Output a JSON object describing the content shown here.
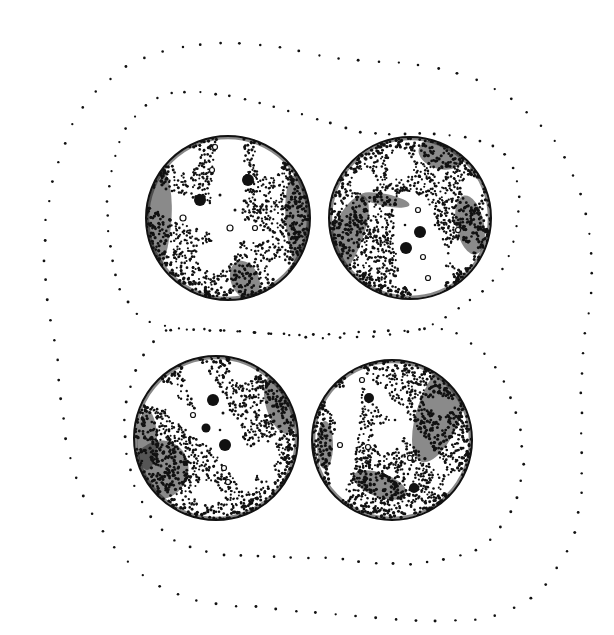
{
  "figure": {
    "ink_color": "#111111",
    "background_color": "#ffffff",
    "cell_count": 4,
    "envelopes": [
      "outer-envelope",
      "inner-envelope-upper",
      "inner-envelope-lower"
    ],
    "cells": [
      {
        "id": "cell-top-left",
        "features": [
          "light-cross-band",
          "dark-granules",
          "light-vacuoles",
          "dark-crescent"
        ]
      },
      {
        "id": "cell-top-right",
        "features": [
          "light-central-band",
          "dark-granules",
          "light-vacuoles",
          "dark-crescent"
        ]
      },
      {
        "id": "cell-bottom-left",
        "features": [
          "light-cross-band",
          "dark-granules",
          "light-vacuoles",
          "dark-crescent"
        ]
      },
      {
        "id": "cell-bottom-right",
        "features": [
          "light-curved-band",
          "dark-lens-body",
          "dark-granules",
          "light-vacuoles"
        ]
      }
    ]
  }
}
